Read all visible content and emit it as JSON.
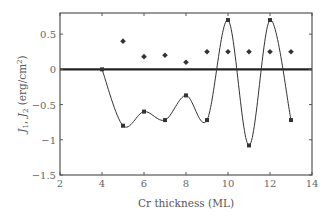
{
  "chart_data": {
    "type": "line",
    "title": "",
    "xlabel": "Cr thickness (ML)",
    "ylabel": "J1, J2 (erg/cm2)",
    "ylabel_parts": {
      "j1": "J",
      "sub1": "1",
      "sep": ", ",
      "j2": "J",
      "sub2": "2",
      "unit_open": " (erg/cm",
      "sup": "2",
      "unit_close": ")"
    },
    "xlim": [
      2,
      14
    ],
    "ylim": [
      -1.5,
      0.8
    ],
    "x_ticks": [
      2,
      4,
      6,
      8,
      10,
      12,
      14
    ],
    "x_tick_labels": [
      "2",
      "4",
      "6",
      "8",
      "10",
      "12",
      "14"
    ],
    "y_ticks": [
      0.5,
      0,
      -0.5,
      -1,
      -1.5
    ],
    "y_tick_labels": [
      "0.5",
      "0",
      "−0.5",
      "−1",
      "−1.5"
    ],
    "grid": false,
    "legend": null,
    "zero_line": true,
    "series": [
      {
        "name": "J1",
        "marker": "square",
        "line": "smooth",
        "x": [
          4,
          5,
          6,
          7,
          8,
          9,
          10,
          11,
          12,
          13
        ],
        "values": [
          0,
          -0.8,
          -0.6,
          -0.72,
          -0.37,
          -0.72,
          0.7,
          -1.08,
          0.7,
          -0.72
        ]
      },
      {
        "name": "J2",
        "marker": "diamond",
        "line": "none",
        "x": [
          5,
          6,
          7,
          8,
          9,
          10,
          11,
          12,
          13
        ],
        "values": [
          0.4,
          0.18,
          0.2,
          0.1,
          0.25,
          0.25,
          0.25,
          0.25,
          0.25
        ]
      }
    ]
  },
  "colors": {
    "axis": "#555555",
    "series": "#333333",
    "zero_line": "#222222"
  }
}
